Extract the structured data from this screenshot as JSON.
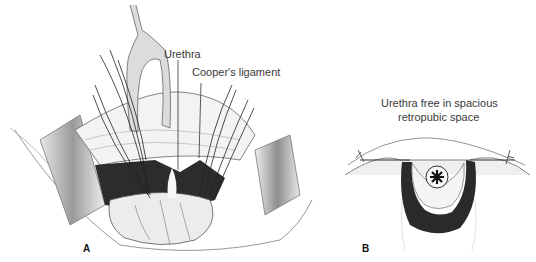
{
  "figure": {
    "panels": [
      {
        "id": "A",
        "letter": "A",
        "labels": {
          "urethra": "Urethra",
          "coopers_ligament": "Cooper's ligament"
        }
      },
      {
        "id": "B",
        "letter": "B",
        "caption_line1": "Urethra free in spacious",
        "caption_line2": "retropubic space"
      }
    ]
  }
}
